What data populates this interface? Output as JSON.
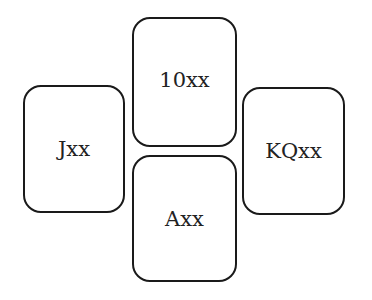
{
  "diagram": {
    "type": "bridge-suit-layout",
    "hands": {
      "north": {
        "label": "10xx"
      },
      "west": {
        "label": "Jxx"
      },
      "east": {
        "label": "KQxx"
      },
      "south": {
        "label": "Axx"
      }
    }
  }
}
